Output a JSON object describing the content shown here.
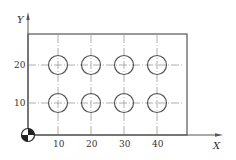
{
  "diagram": {
    "type": "hole-pattern-drawing",
    "axes": {
      "x_label": "X",
      "y_label": "Y"
    },
    "x_ticks": [
      "10",
      "20",
      "30",
      "40"
    ],
    "y_ticks": [
      "20",
      "10"
    ],
    "holes": [
      {
        "x": 10,
        "y": 20
      },
      {
        "x": 20,
        "y": 20
      },
      {
        "x": 30,
        "y": 20
      },
      {
        "x": 40,
        "y": 20
      },
      {
        "x": 10,
        "y": 10
      },
      {
        "x": 20,
        "y": 10
      },
      {
        "x": 30,
        "y": 10
      },
      {
        "x": 40,
        "y": 10
      }
    ],
    "origin_symbol": "workpiece-zero-symbol",
    "colors": {
      "line": "#555555",
      "centerline": "#999999",
      "background": "#ffffff"
    }
  }
}
